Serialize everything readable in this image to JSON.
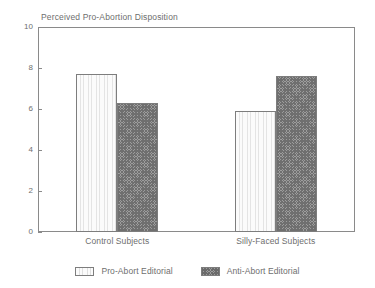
{
  "chart_data": {
    "type": "bar",
    "title": "Perceived Pro-Abortion Disposition",
    "xlabel": "",
    "ylabel": "",
    "ylim": [
      0,
      10
    ],
    "yticks": [
      0,
      2,
      4,
      6,
      8,
      10
    ],
    "ytick_labels": [
      "0",
      "2",
      "4",
      "6",
      "8",
      "10"
    ],
    "grid": false,
    "legend_position": "bottom-center",
    "categories": [
      "Control Subjects",
      "Silly-Faced Subjects"
    ],
    "series": [
      {
        "name": "Pro-Abort Editorial",
        "values": [
          7.7,
          5.9
        ],
        "fill": "light-vertical-hatch",
        "color": "#f4f4f4"
      },
      {
        "name": "Anti-Abort Editorial",
        "values": [
          6.3,
          7.6
        ],
        "fill": "dark-cross-hatch",
        "color": "#9d9d9d"
      }
    ]
  },
  "axis": {
    "frame_color": "#8a8a8a",
    "text_color": "#6e6e6e"
  }
}
